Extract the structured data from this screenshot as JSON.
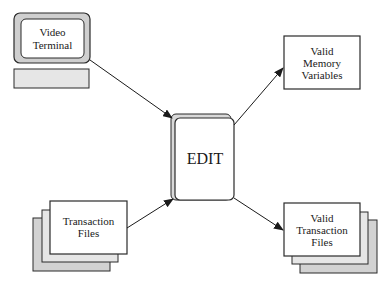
{
  "diagram": {
    "type": "data-flow",
    "colors": {
      "stroke": "#2a2a2a",
      "fill_white": "#ffffff",
      "fill_light_gray": "#e6e6e6",
      "fill_mid_gray": "#d2d2d2",
      "monitor_frame": "#cfcfcf"
    },
    "nodes": {
      "video_terminal": {
        "line1": "Video",
        "line2": "Terminal",
        "shape": "monitor-icon"
      },
      "edit": {
        "label": "EDIT",
        "shape": "stacked-rounded-box"
      },
      "valid_memory_variables": {
        "line1": "Valid",
        "line2": "Memory",
        "line3": "Variables",
        "shape": "box"
      },
      "transaction_files": {
        "line1": "Transaction",
        "line2": "Files",
        "shape": "stacked-documents"
      },
      "valid_transaction_files": {
        "line1": "Valid",
        "line2": "Transaction",
        "line3": "Files",
        "shape": "stacked-documents"
      }
    },
    "edges": [
      {
        "from": "Video Terminal",
        "to": "EDIT"
      },
      {
        "from": "Transaction Files",
        "to": "EDIT"
      },
      {
        "from": "EDIT",
        "to": "Valid Memory Variables"
      },
      {
        "from": "EDIT",
        "to": "Valid Transaction Files"
      }
    ]
  }
}
